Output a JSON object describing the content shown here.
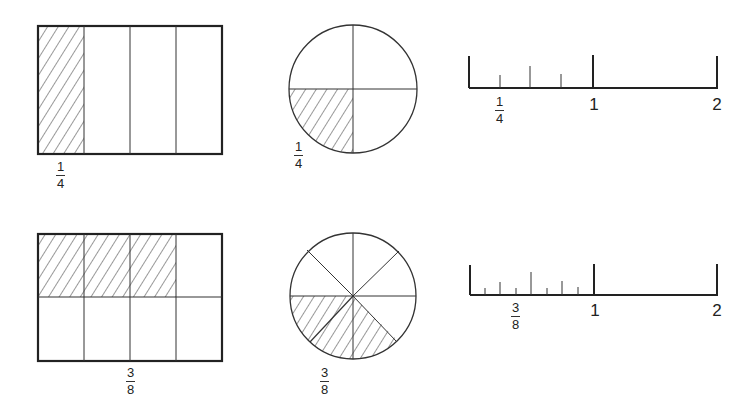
{
  "figure": {
    "rows": [
      {
        "fraction": "1/4",
        "rectangle": {
          "columns": 4,
          "rows": 1,
          "shaded_cells": 1,
          "label": {
            "numerator": "1",
            "denominator": "4"
          }
        },
        "circle": {
          "parts": 4,
          "shaded_parts": 1,
          "label": {
            "numerator": "1",
            "denominator": "4"
          }
        },
        "number_line": {
          "subdivisions_per_unit": 4,
          "tick_labels": [
            "1",
            "2"
          ],
          "marked_label": {
            "numerator": "1",
            "denominator": "4"
          }
        }
      },
      {
        "fraction": "3/8",
        "rectangle": {
          "columns": 4,
          "rows": 2,
          "shaded_cells": 3,
          "label": {
            "numerator": "3",
            "denominator": "8"
          }
        },
        "circle": {
          "parts": 8,
          "shaded_parts": 3,
          "label": {
            "numerator": "3",
            "denominator": "8"
          }
        },
        "number_line": {
          "subdivisions_per_unit": 8,
          "tick_labels": [
            "1",
            "2"
          ],
          "marked_label": {
            "numerator": "3",
            "denominator": "8"
          }
        }
      }
    ],
    "colors": {
      "stroke": "#222222",
      "background": "#ffffff"
    }
  }
}
